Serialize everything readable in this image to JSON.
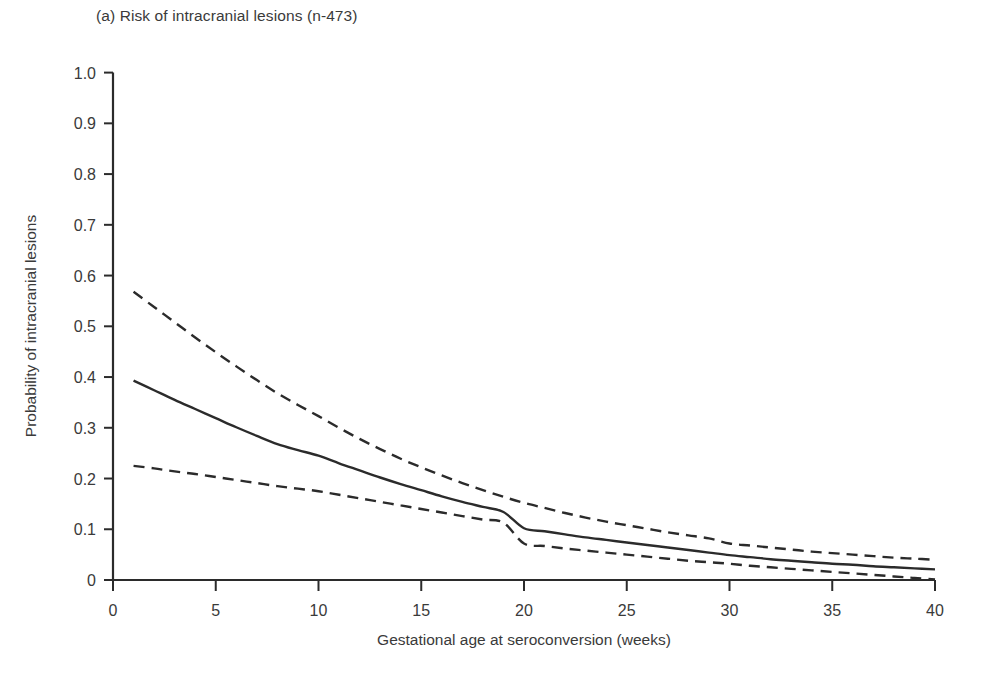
{
  "figure": {
    "panel_label": "(a) Risk of intracranial lesions (n-473)",
    "background_color": "#ffffff",
    "line_color": "#2b2b2b",
    "text_color": "#3a3a3a"
  },
  "chart_data": {
    "type": "line",
    "title": "(a) Risk of intracranial lesions (n-473)",
    "xlabel": "Gestational age at seroconversion (weeks)",
    "ylabel": "Probability of intracranial lesions",
    "xlim": [
      0,
      40
    ],
    "ylim": [
      0,
      1.0
    ],
    "xticks": [
      0,
      5,
      10,
      15,
      20,
      25,
      30,
      35,
      40
    ],
    "xtick_labels": [
      "0",
      "5",
      "10",
      "15",
      "20",
      "25",
      "30",
      "35",
      "40"
    ],
    "yticks": [
      0,
      0.1,
      0.2,
      0.3,
      0.4,
      0.5,
      0.6,
      0.7,
      0.8,
      0.9,
      1.0
    ],
    "ytick_labels": [
      "0",
      "0.1",
      "0.2",
      "0.3",
      "0.4",
      "0.5",
      "0.6",
      "0.7",
      "0.8",
      "0.9",
      "1.0"
    ],
    "grid": false,
    "legend": null,
    "x": [
      1,
      2,
      3,
      4,
      5,
      6,
      7,
      8,
      9,
      10,
      11,
      12,
      13,
      14,
      15,
      16,
      17,
      18,
      19,
      20,
      21,
      22,
      23,
      24,
      25,
      26,
      27,
      28,
      29,
      30,
      31,
      32,
      33,
      34,
      35,
      36,
      37,
      38,
      39,
      40
    ],
    "series": [
      {
        "name": "Upper 95% confidence limit",
        "style": "dashed",
        "values": [
          0.568,
          0.538,
          0.508,
          0.478,
          0.449,
          0.421,
          0.394,
          0.368,
          0.345,
          0.323,
          0.3,
          0.278,
          0.258,
          0.239,
          0.222,
          0.206,
          0.191,
          0.177,
          0.164,
          0.152,
          0.142,
          0.132,
          0.123,
          0.115,
          0.108,
          0.101,
          0.094,
          0.088,
          0.082,
          0.072,
          0.068,
          0.064,
          0.06,
          0.056,
          0.053,
          0.05,
          0.047,
          0.044,
          0.042,
          0.04
        ]
      },
      {
        "name": "Predicted probability",
        "style": "solid",
        "values": [
          0.393,
          0.374,
          0.355,
          0.337,
          0.319,
          0.301,
          0.284,
          0.268,
          0.256,
          0.245,
          0.23,
          0.216,
          0.202,
          0.189,
          0.177,
          0.165,
          0.154,
          0.144,
          0.134,
          0.102,
          0.096,
          0.09,
          0.084,
          0.079,
          0.074,
          0.069,
          0.064,
          0.059,
          0.054,
          0.049,
          0.045,
          0.041,
          0.038,
          0.035,
          0.032,
          0.03,
          0.027,
          0.025,
          0.023,
          0.021
        ]
      },
      {
        "name": "Lower 95% confidence limit",
        "style": "dashed",
        "values": [
          0.225,
          0.22,
          0.214,
          0.209,
          0.203,
          0.197,
          0.191,
          0.185,
          0.18,
          0.175,
          0.168,
          0.161,
          0.154,
          0.147,
          0.14,
          0.133,
          0.126,
          0.119,
          0.113,
          0.072,
          0.067,
          0.062,
          0.058,
          0.054,
          0.05,
          0.046,
          0.042,
          0.038,
          0.035,
          0.032,
          0.028,
          0.025,
          0.022,
          0.019,
          0.016,
          0.013,
          0.01,
          0.007,
          0.004,
          0.001
        ]
      }
    ]
  }
}
